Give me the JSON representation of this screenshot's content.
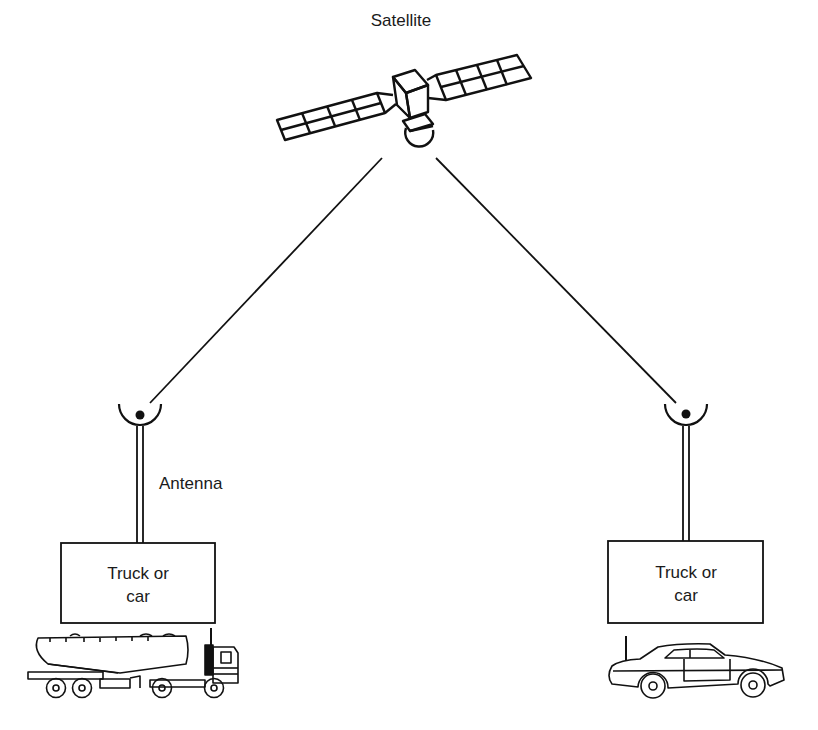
{
  "diagram": {
    "title_label": "Satellite",
    "antenna_label": "Antenna",
    "left_box": {
      "line1": "Truck or",
      "line2": "car"
    },
    "right_box": {
      "line1": "Truck or",
      "line2": "car"
    },
    "left_vehicle": "tanker-truck",
    "right_vehicle": "car"
  },
  "colors": {
    "ink": "#111111",
    "background": "#ffffff"
  }
}
